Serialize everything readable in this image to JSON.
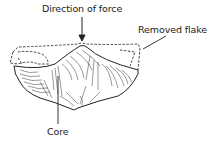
{
  "diagram": {
    "labels": {
      "force": "Direction of force",
      "flake": "Removed flake",
      "core": "Core"
    },
    "colors": {
      "ink": "#222222",
      "background": "#ffffff"
    }
  }
}
